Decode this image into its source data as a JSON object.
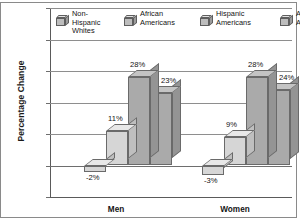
{
  "chart_data": {
    "type": "bar",
    "title": "",
    "xlabel": "",
    "ylabel": "Percentage Change",
    "categories": [
      "Men",
      "Women"
    ],
    "series": [
      {
        "name": "Non-Hispanic Whites",
        "values": [
          -2,
          -3
        ],
        "labels": [
          "-2%",
          "-3%"
        ],
        "color": "#d6d6d6"
      },
      {
        "name": "African Americans",
        "values": [
          11,
          9
        ],
        "labels": [
          "11%",
          "9%"
        ],
        "color": "#d6d6d6"
      },
      {
        "name": "Hispanic Americans",
        "values": [
          28,
          28
        ],
        "labels": [
          "28%",
          "28%"
        ],
        "color": "#aaaaaa"
      },
      {
        "name": "Asian Americans",
        "values": [
          23,
          24
        ],
        "labels": [
          "23%",
          "24%"
        ],
        "color": "#aaaaaa"
      }
    ],
    "ylim": [
      -10,
      50
    ],
    "ytick_values": [
      50,
      40,
      30,
      20,
      10,
      0,
      -10
    ],
    "ytick_labels": [
      "+50%",
      "+40%",
      "+30%",
      "+20%",
      "+10%",
      "0%",
      "-10%"
    ],
    "grid": true,
    "legend_position": "top-inside",
    "style": "3d-bar-grayscale"
  },
  "legend": {
    "items": [
      {
        "label_line1": "Non-",
        "label_line2": "Hispanic",
        "label_line3": "Whites",
        "icon": "cube-icon"
      },
      {
        "label_line1": "African",
        "label_line2": "Americans",
        "label_line3": "",
        "icon": "cube-icon"
      },
      {
        "label_line1": "Hispanic",
        "label_line2": "Americans",
        "label_line3": "",
        "icon": "cube-icon"
      },
      {
        "label_line1": "Asian",
        "label_line2": "Americans",
        "label_line3": "",
        "icon": "cube-icon"
      }
    ]
  },
  "axis": {
    "y_title": "Percentage Change"
  }
}
